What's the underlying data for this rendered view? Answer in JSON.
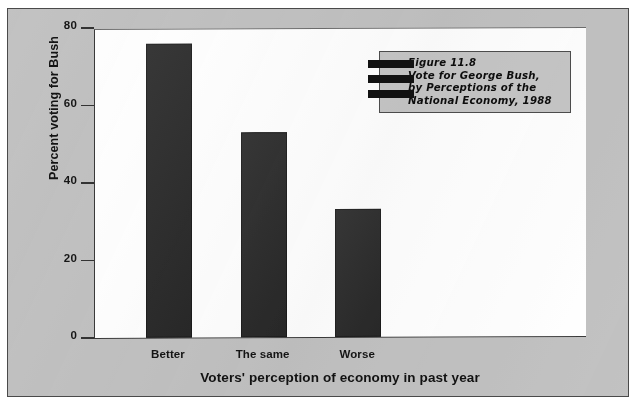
{
  "figure": {
    "caption": "Figure 11.8\nVote for George Bush,\nby Perceptions of the\nNational Economy, 1988",
    "panel_color": "#c2c2c2",
    "bar_color": "#2d2d2d"
  },
  "chart_data": {
    "type": "bar",
    "title": "Figure 11.8 Vote for George Bush, by Perceptions of the National Economy, 1988",
    "categories": [
      "Better",
      "The same",
      "Worse"
    ],
    "values": [
      76,
      53,
      33
    ],
    "xlabel": "Voters' perception of economy in past year",
    "ylabel": "Percent voting for Bush",
    "ylim": [
      0,
      80
    ],
    "yticks": [
      0,
      20,
      40,
      60,
      80
    ],
    "ytick_labels": [
      "0",
      "20",
      "40",
      "60",
      "80"
    ],
    "grid": false,
    "legend": "none"
  }
}
